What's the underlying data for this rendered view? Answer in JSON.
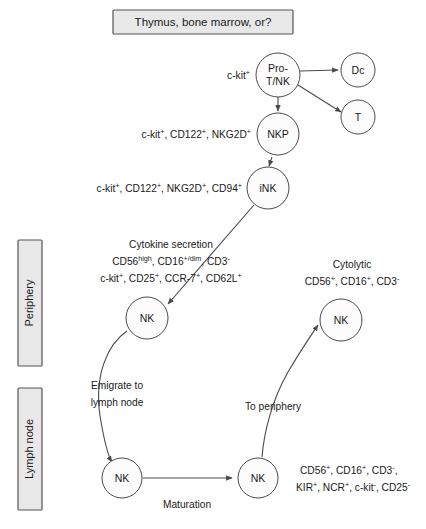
{
  "figure": {
    "title_box": "Thymus, bone marrow, or?",
    "bands": [
      {
        "id": "periphery",
        "label": "Periphery"
      },
      {
        "id": "lymph-node",
        "label": "Lymph node"
      }
    ],
    "nodes": [
      {
        "id": "pro-t-nk",
        "label_lines": [
          "Pro-",
          "T/NK"
        ]
      },
      {
        "id": "dc",
        "label_lines": [
          "Dc"
        ]
      },
      {
        "id": "t",
        "label_lines": [
          "T"
        ]
      },
      {
        "id": "nkp",
        "label_lines": [
          "NKP"
        ]
      },
      {
        "id": "ink",
        "label_lines": [
          "iNK"
        ]
      },
      {
        "id": "nk-cytokine",
        "label_lines": [
          "NK"
        ]
      },
      {
        "id": "nk-cytolytic",
        "label_lines": [
          "NK"
        ]
      },
      {
        "id": "nk-ln-immature",
        "label_lines": [
          "NK"
        ]
      },
      {
        "id": "nk-ln-mature",
        "label_lines": [
          "NK"
        ]
      }
    ],
    "markers": {
      "pro_t_nk": [
        {
          "base": "c-kit",
          "sup": "+"
        }
      ],
      "nkp": [
        {
          "base": "c-kit",
          "sup": "+"
        },
        {
          "base": "CD122",
          "sup": "+"
        },
        {
          "base": "NKG2D",
          "sup": "+"
        }
      ],
      "ink": [
        {
          "base": "c-kit",
          "sup": "+"
        },
        {
          "base": "CD122",
          "sup": "+"
        },
        {
          "base": "NKG2D",
          "sup": "+"
        },
        {
          "base": "CD94",
          "sup": "+"
        }
      ],
      "cytokine_heading": "Cytokine secretion",
      "cytokine_line1": [
        {
          "base": "CD56",
          "sup": "high"
        },
        {
          "base": "CD16",
          "sup": "+/dim"
        },
        {
          "base": "CD3",
          "sup": "-"
        }
      ],
      "cytokine_line2": [
        {
          "base": "c-kit",
          "sup": "+"
        },
        {
          "base": "CD25",
          "sup": "+"
        },
        {
          "base": "CCR-7",
          "sup": "+"
        },
        {
          "base": "CD62L",
          "sup": "+"
        }
      ],
      "cytolytic_heading": "Cytolytic",
      "cytolytic_line1": [
        {
          "base": "CD56",
          "sup": "+"
        },
        {
          "base": "CD16",
          "sup": "+"
        },
        {
          "base": "CD3",
          "sup": "-"
        }
      ],
      "mature_line1": [
        {
          "base": "CD56",
          "sup": "+"
        },
        {
          "base": "CD16",
          "sup": "+"
        },
        {
          "base": "CD3",
          "sup": "-"
        }
      ],
      "mature_line2": [
        {
          "base": "KIR",
          "sup": "+"
        },
        {
          "base": "NCR",
          "sup": "+"
        },
        {
          "base": "c-kit",
          "sup": "-"
        },
        {
          "base": "CD25",
          "sup": "-"
        }
      ]
    },
    "edge_labels": {
      "emigrate_line1": "Emigrate to",
      "emigrate_line2": "lymph node",
      "to_periphery": "To periphery",
      "maturation": "Maturation"
    },
    "colors": {
      "box_fill": "#e8e8e8",
      "box_stroke": "#555555",
      "node_stroke": "#4a4a4a",
      "node_fill": "#fcfcfc",
      "text": "#1a1a1a"
    }
  }
}
